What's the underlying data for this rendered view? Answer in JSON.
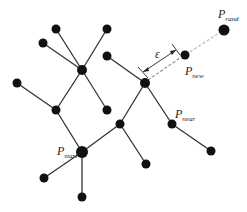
{
  "diagram": {
    "labels": {
      "start": {
        "main": "P",
        "sub": "start"
      },
      "near": {
        "main": "P",
        "sub": "near"
      },
      "new": {
        "main": "P",
        "sub": "new"
      },
      "rand": {
        "main": "P",
        "sub": "rand"
      },
      "step": "ε"
    },
    "colors": {
      "node": "#111111",
      "edge": "#333333",
      "dashed": "#b8b8b8"
    }
  }
}
